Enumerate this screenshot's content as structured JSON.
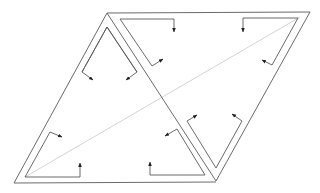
{
  "diagram": {
    "description": "Parallelogram split into two triangles with double-line borders and circulating flow arrows",
    "colors": {
      "line": "#5a5a5a",
      "diagonal": "#c8c8c8",
      "background": "#ffffff"
    },
    "outer_vertices": {
      "A": [
        107,
        13
      ],
      "B": [
        310,
        12
      ],
      "C": [
        216,
        181
      ],
      "D": [
        14,
        183
      ]
    },
    "outer_edges": [
      {
        "id": "AB",
        "from": [
          107,
          13
        ],
        "to": [
          310,
          12
        ]
      },
      {
        "id": "AD",
        "from": [
          107,
          13
        ],
        "to": [
          14,
          183
        ]
      },
      {
        "id": "DC",
        "from": [
          14,
          183
        ],
        "to": [
          216,
          182
        ]
      },
      {
        "id": "BC",
        "from": [
          310,
          12
        ],
        "to": [
          216,
          181
        ]
      },
      {
        "id": "AC",
        "from": [
          107,
          13
        ],
        "to": [
          216,
          181
        ]
      }
    ],
    "faint_diagonal": {
      "from": [
        25,
        177
      ],
      "to": [
        300,
        17
      ]
    },
    "flow_paths": [
      {
        "id": "left-tri-top-left",
        "points": [
          [
            107,
            27
          ],
          [
            82,
            72
          ]
        ],
        "arrow_to": [
          93,
          80
        ]
      },
      {
        "id": "left-tri-top-right",
        "points": [
          [
            107,
            27
          ],
          [
            137,
            72
          ]
        ],
        "arrow_to": [
          126,
          80
        ]
      },
      {
        "id": "left-tri-left-lower",
        "points": [
          [
            25,
            177
          ],
          [
            50,
            132
          ]
        ],
        "arrow_to": [
          62,
          137
        ]
      },
      {
        "id": "left-tri-bottom-left",
        "points": [
          [
            25,
            177
          ],
          [
            80,
            177
          ]
        ],
        "arrow_to": [
          80,
          163
        ]
      },
      {
        "id": "left-tri-bottom-right",
        "points": [
          [
            205,
            175
          ],
          [
            150,
            175
          ]
        ],
        "arrow_to": [
          150,
          162
        ]
      },
      {
        "id": "left-tri-right-lower",
        "points": [
          [
            205,
            175
          ],
          [
            177,
            129
          ]
        ],
        "arrow_to": [
          165,
          136
        ]
      },
      {
        "id": "right-tri-top-left",
        "points": [
          [
            120,
            19
          ],
          [
            174,
            19
          ]
        ],
        "arrow_to": [
          174,
          32
        ]
      },
      {
        "id": "right-tri-diag-left",
        "points": [
          [
            120,
            19
          ],
          [
            152,
            66
          ]
        ],
        "arrow_to": [
          163,
          59
        ]
      },
      {
        "id": "right-tri-top-right",
        "points": [
          [
            298,
            18
          ],
          [
            243,
            18
          ]
        ],
        "arrow_to": [
          243,
          32
        ]
      },
      {
        "id": "right-tri-right-leg",
        "points": [
          [
            298,
            18
          ],
          [
            272,
            65
          ]
        ],
        "arrow_to": [
          262,
          60
        ]
      },
      {
        "id": "right-tri-v-left",
        "points": [
          [
            216,
            168
          ],
          [
            187,
            121
          ]
        ],
        "arrow_to": [
          197,
          115
        ]
      },
      {
        "id": "right-tri-v-right",
        "points": [
          [
            216,
            168
          ],
          [
            242,
            121
          ]
        ],
        "arrow_to": [
          232,
          114
        ]
      }
    ]
  }
}
